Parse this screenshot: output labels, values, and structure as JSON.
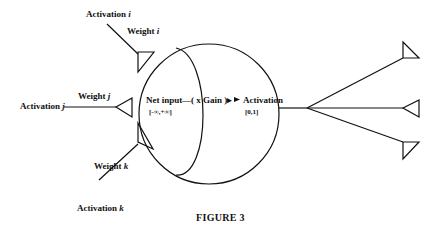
{
  "figure": {
    "caption": "FIGURE 3",
    "inputs": [
      {
        "activation_label": "Activation",
        "activation_var": "i",
        "weight_label": "Weight",
        "weight_var": "i"
      },
      {
        "activation_label": "Activation",
        "activation_var": "j",
        "weight_label": "Weight",
        "weight_var": "j"
      },
      {
        "activation_label": "Activation",
        "activation_var": "k",
        "weight_label": "Weight",
        "weight_var": "k"
      }
    ],
    "unit": {
      "net_input_label": "Net input",
      "net_input_range": "[-∞,+∞]",
      "gain_label": "—( x Gain )▸",
      "activation_label": "Activation",
      "activation_range": "[0,1]"
    },
    "outputs": {
      "count": 3,
      "shape": "triangle-synapse"
    },
    "colors": {
      "stroke": "#111111",
      "background": "#ffffff"
    }
  }
}
